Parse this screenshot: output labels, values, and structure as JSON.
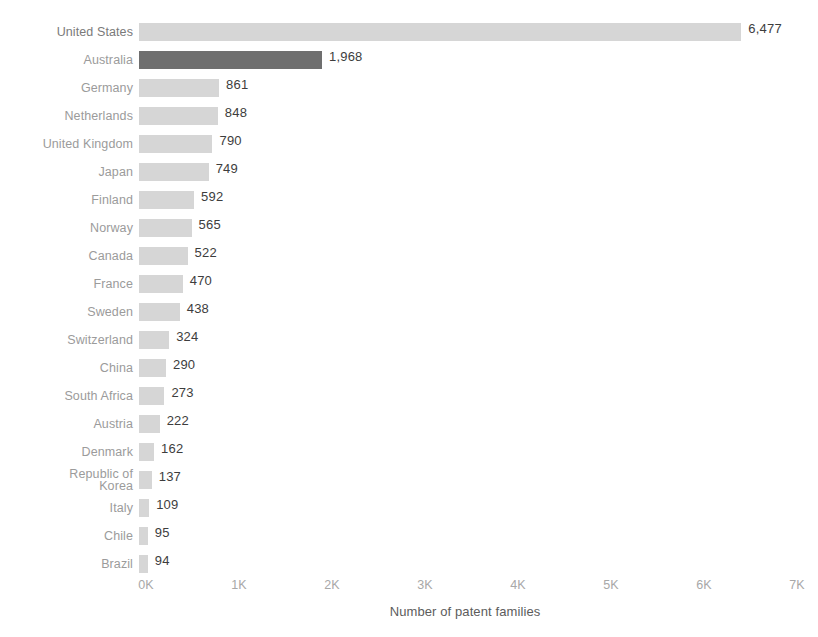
{
  "chart_data": {
    "type": "bar",
    "orientation": "horizontal",
    "title": "",
    "subtitle": "",
    "xlabel": "Number of patent families",
    "ylabel": "",
    "xlim": [
      0,
      7000
    ],
    "grid": false,
    "legend": null,
    "value_label_format": "comma-separated integer",
    "categories": [
      "United States",
      "Australia",
      "Germany",
      "Netherlands",
      "United Kingdom",
      "Japan",
      "Finland",
      "Norway",
      "Canada",
      "France",
      "Sweden",
      "Switzerland",
      "China",
      "South Africa",
      "Austria",
      "Denmark",
      "Republic of Korea",
      "Italy",
      "Chile",
      "Brazil"
    ],
    "values": [
      6477,
      1968,
      861,
      848,
      790,
      749,
      592,
      565,
      522,
      470,
      438,
      324,
      290,
      273,
      222,
      162,
      137,
      109,
      95,
      94
    ],
    "value_labels": [
      "6,477",
      "1,968",
      "861",
      "848",
      "790",
      "749",
      "592",
      "565",
      "522",
      "470",
      "438",
      "324",
      "290",
      "273",
      "222",
      "162",
      "137",
      "109",
      "95",
      "94"
    ],
    "highlighted_category": "Australia",
    "xticks": [
      0,
      1000,
      2000,
      3000,
      4000,
      5000,
      6000,
      7000
    ],
    "xticklabels": [
      "0K",
      "1K",
      "2K",
      "3K",
      "4K",
      "5K",
      "6K",
      "7K"
    ],
    "colors": {
      "bar": "#d6d6d6",
      "bar_highlight": "#6f6f6f",
      "category_label": "#9b9b9b",
      "value_label": "#3d3d3d",
      "tick_label": "#a8a8a8",
      "axis_title": "#5c5c5c",
      "background": "#ffffff"
    }
  }
}
